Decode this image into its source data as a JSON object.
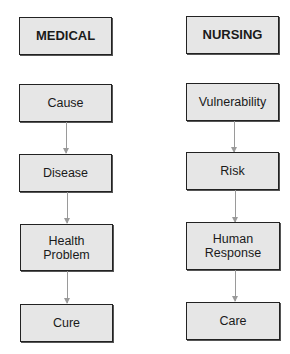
{
  "columns": [
    {
      "header": "MEDICAL",
      "steps": [
        "Cause",
        "Disease",
        "Health Problem",
        "Cure"
      ]
    },
    {
      "header": "NURSING",
      "steps": [
        "Vulnerability",
        "Risk",
        "Human Response",
        "Care"
      ]
    }
  ],
  "colors": {
    "box_fill": "#e6e6e6",
    "border": "#222222",
    "arrow": "#9a9a9a"
  }
}
